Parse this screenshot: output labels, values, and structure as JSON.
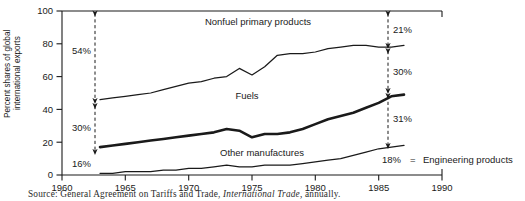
{
  "figure": {
    "source_prefix": "Source:",
    "source_text": "General Agreement on Tariffs and Trade,",
    "source_italic": "International Trade,",
    "source_suffix": "annually."
  },
  "axes": {
    "ylabel_line1": "Percent shares of global",
    "ylabel_line2": "international exports",
    "xlabel": "",
    "yticks": [
      "0",
      "20",
      "40",
      "60",
      "80",
      "100"
    ],
    "xticks": [
      "1960",
      "1965",
      "1970",
      "1975",
      "1980",
      "1985",
      "1990"
    ]
  },
  "series_labels": {
    "nonfuel": "Nonfuel primary products",
    "fuels": "Fuels",
    "other_manufactures": "Other manufactures"
  },
  "legend": {
    "value": "18%",
    "equals": "=",
    "label": "Engineering products"
  },
  "annotations_left": {
    "nonfuel": "54%",
    "fuels": "30%",
    "other": "16%"
  },
  "annotations_right": {
    "nonfuel": "21%",
    "fuels": "30%",
    "other": "31%",
    "engineering": "18%"
  },
  "chart_data": {
    "type": "line",
    "title": "",
    "xlabel": "",
    "ylabel": "Percent shares of global international exports",
    "xlim": [
      1960,
      1990
    ],
    "ylim": [
      0,
      100
    ],
    "grid": false,
    "legend_position": "inline-right",
    "x": [
      1963,
      1964,
      1965,
      1966,
      1967,
      1968,
      1969,
      1970,
      1971,
      1972,
      1973,
      1974,
      1975,
      1976,
      1977,
      1978,
      1979,
      1980,
      1981,
      1982,
      1983,
      1984,
      1985,
      1986,
      1987
    ],
    "series": [
      {
        "name": "Cumulative top boundary (engineering + other manufactures + fuels)",
        "description": "Upper line: below it is Nonfuel primary products share to 100",
        "values": [
          46,
          47,
          48,
          49,
          50,
          52,
          54,
          56,
          57,
          59,
          60,
          65,
          61,
          66,
          73,
          74,
          74,
          75,
          77,
          78,
          79,
          79,
          78,
          78,
          79
        ]
      },
      {
        "name": "Cumulative middle boundary (engineering + other manufactures)",
        "description": "Thick line: between it and upper line is Fuels share",
        "values": [
          17,
          18,
          19,
          20,
          21,
          22,
          23,
          24,
          25,
          26,
          28,
          27,
          23,
          25,
          25,
          26,
          28,
          31,
          34,
          36,
          38,
          41,
          44,
          48,
          49
        ]
      },
      {
        "name": "Engineering products",
        "description": "Bottom line: share of engineering products",
        "values": [
          1,
          1,
          2,
          2,
          2,
          3,
          3,
          4,
          4,
          5,
          6,
          5,
          5,
          6,
          6,
          6,
          7,
          8,
          9,
          10,
          12,
          14,
          16,
          17,
          18
        ]
      }
    ],
    "band_shares_1963": {
      "nonfuel_primary_products": 54,
      "fuels": 30,
      "other_manufactures_plus_engineering": 16
    },
    "band_shares_1987": {
      "nonfuel_primary_products": 21,
      "fuels": 30,
      "other_manufactures": 31,
      "engineering_products": 18
    }
  },
  "colors": {
    "line": "#1a1a1a",
    "background": "#ffffff",
    "text": "#1a1a1a"
  }
}
